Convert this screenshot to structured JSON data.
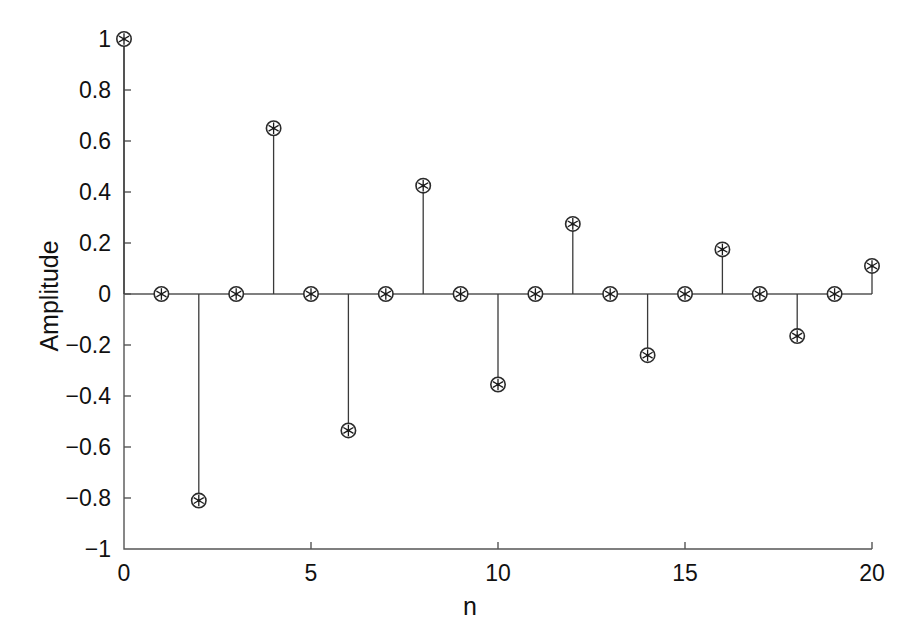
{
  "chart_data": {
    "type": "line",
    "plot_style": "stem",
    "title": "",
    "xlabel": "n",
    "ylabel": "Amplitude",
    "x": [
      0,
      1,
      2,
      3,
      4,
      5,
      6,
      7,
      8,
      9,
      10,
      11,
      12,
      13,
      14,
      15,
      16,
      17,
      18,
      19,
      20
    ],
    "values": [
      1.0,
      0.0,
      -0.81,
      0.0,
      0.65,
      0.0,
      -0.535,
      0.0,
      0.425,
      0.0,
      -0.355,
      0.0,
      0.275,
      0.0,
      -0.24,
      0.0,
      0.175,
      0.0,
      -0.165,
      0.0,
      0.11
    ],
    "xlim": [
      0,
      20
    ],
    "ylim": [
      -1,
      1
    ],
    "xticks": [
      0,
      5,
      10,
      15,
      20
    ],
    "xtick_labels": [
      "0",
      "5",
      "10",
      "15",
      "20"
    ],
    "yticks": [
      -1,
      -0.8,
      -0.6,
      -0.4,
      -0.2,
      0,
      0.2,
      0.4,
      0.6,
      0.8,
      1
    ],
    "ytick_labels": [
      "-1",
      "-0.8",
      "-0.6",
      "-0.4",
      "-0.2",
      "0",
      "0.2",
      "0.4",
      "0.6",
      "0.8",
      "1"
    ],
    "grid": false,
    "legend": null,
    "marker": "circle-star",
    "series_color": "#2b2b2b",
    "axis_color": "#555555"
  }
}
